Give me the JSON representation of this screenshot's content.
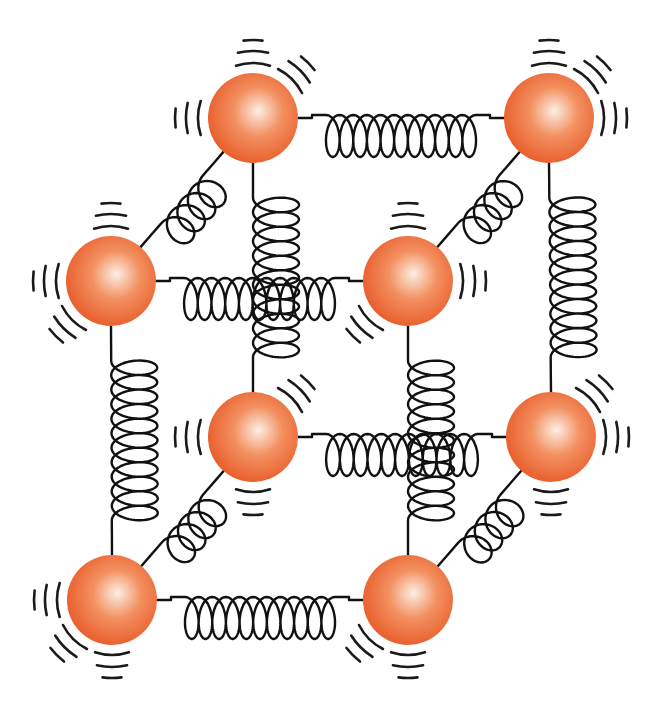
{
  "diagram": {
    "title": "Ball-and-spring model of a crystal lattice",
    "colors": {
      "atom_center": "#fdeee4",
      "atom_mid": "#f39060",
      "atom_edge": "#e85a28",
      "spring": "#111111",
      "vibration_marks": "#1a1a1a",
      "background": "#ffffff"
    },
    "atom_radius": 45,
    "atoms": [
      {
        "id": "back-top-left",
        "x": 253,
        "y": 118,
        "marks": [
          "up",
          "up-right",
          "left"
        ]
      },
      {
        "id": "back-top-right",
        "x": 549,
        "y": 118,
        "marks": [
          "up",
          "up-right",
          "right"
        ]
      },
      {
        "id": "front-top-left",
        "x": 111,
        "y": 281,
        "marks": [
          "up",
          "left",
          "down-left"
        ]
      },
      {
        "id": "front-top-right",
        "x": 408,
        "y": 281,
        "marks": [
          "up",
          "right",
          "down-left"
        ]
      },
      {
        "id": "back-bottom-left",
        "x": 253,
        "y": 437,
        "marks": [
          "up-right",
          "left",
          "down"
        ]
      },
      {
        "id": "back-bottom-right",
        "x": 551,
        "y": 437,
        "marks": [
          "up-right",
          "right",
          "down"
        ]
      },
      {
        "id": "front-bottom-left",
        "x": 112,
        "y": 600,
        "marks": [
          "left",
          "down-left",
          "down"
        ]
      },
      {
        "id": "front-bottom-right",
        "x": 408,
        "y": 600,
        "marks": [
          "down-left",
          "down"
        ]
      }
    ],
    "springs": [
      {
        "id": "top-back-horizontal",
        "type": "horizontal",
        "from": "back-top-left",
        "to": "back-top-right",
        "coils": 11
      },
      {
        "id": "top-front-horizontal",
        "type": "horizontal",
        "from": "front-top-left",
        "to": "front-top-right",
        "coils": 11
      },
      {
        "id": "bottom-back-horizontal",
        "type": "horizontal",
        "from": "back-bottom-left",
        "to": "back-bottom-right",
        "coils": 11
      },
      {
        "id": "bottom-front-horizontal",
        "type": "horizontal",
        "from": "front-bottom-left",
        "to": "front-bottom-right",
        "coils": 11
      },
      {
        "id": "left-back-vertical",
        "type": "vertical",
        "from": "back-top-left",
        "to": "back-bottom-left",
        "coils": 11
      },
      {
        "id": "right-back-vertical",
        "type": "vertical",
        "from": "back-top-right",
        "to": "back-bottom-right",
        "coils": 11
      },
      {
        "id": "left-front-vertical",
        "type": "vertical",
        "from": "front-top-left",
        "to": "front-bottom-left",
        "coils": 11
      },
      {
        "id": "right-front-vertical",
        "type": "vertical",
        "from": "front-top-right",
        "to": "front-bottom-right",
        "coils": 11
      },
      {
        "id": "top-left-diagonal",
        "type": "diagonal",
        "from": "front-top-left",
        "to": "back-top-left",
        "coils": 4
      },
      {
        "id": "top-right-diagonal",
        "type": "diagonal",
        "from": "front-top-right",
        "to": "back-top-right",
        "coils": 4
      },
      {
        "id": "bottom-left-diagonal",
        "type": "diagonal",
        "from": "front-bottom-left",
        "to": "back-bottom-left",
        "coils": 4
      },
      {
        "id": "bottom-right-diagonal",
        "type": "diagonal",
        "from": "front-bottom-right",
        "to": "back-bottom-right",
        "coils": 4
      }
    ]
  }
}
